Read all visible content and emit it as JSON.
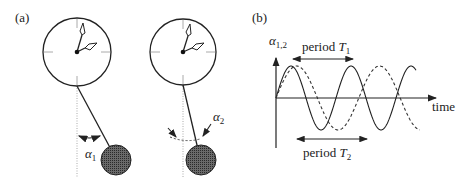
{
  "figure": {
    "panel_a": {
      "label": "(a)",
      "pendulum_1": {
        "angle_label": "α",
        "angle_sub": "1"
      },
      "pendulum_2": {
        "angle_label": "α",
        "angle_sub": "2"
      }
    },
    "panel_b": {
      "label": "(b)",
      "y_axis_label": "α",
      "y_axis_sub": "1,2",
      "x_axis_label": "time",
      "period_1": {
        "text": "period ",
        "symbol": "T",
        "sub": "1"
      },
      "period_2": {
        "text": "period ",
        "symbol": "T",
        "sub": "2"
      }
    }
  },
  "chart_data": {
    "type": "line",
    "title": "",
    "xlabel": "time",
    "ylabel": "α1,2",
    "grid": false,
    "series": [
      {
        "name": "α1 (solid, period T1)",
        "style": "solid",
        "relative_period": 1.0,
        "amplitude": 1
      },
      {
        "name": "α2 (dashed, period T2)",
        "style": "dashed",
        "relative_period": 1.38,
        "amplitude": 1
      }
    ],
    "annotations": [
      "period T1",
      "period T2"
    ]
  },
  "colors": {
    "line": "#222222",
    "bob_fill": "#555555",
    "tick": "#aaaaaa"
  }
}
